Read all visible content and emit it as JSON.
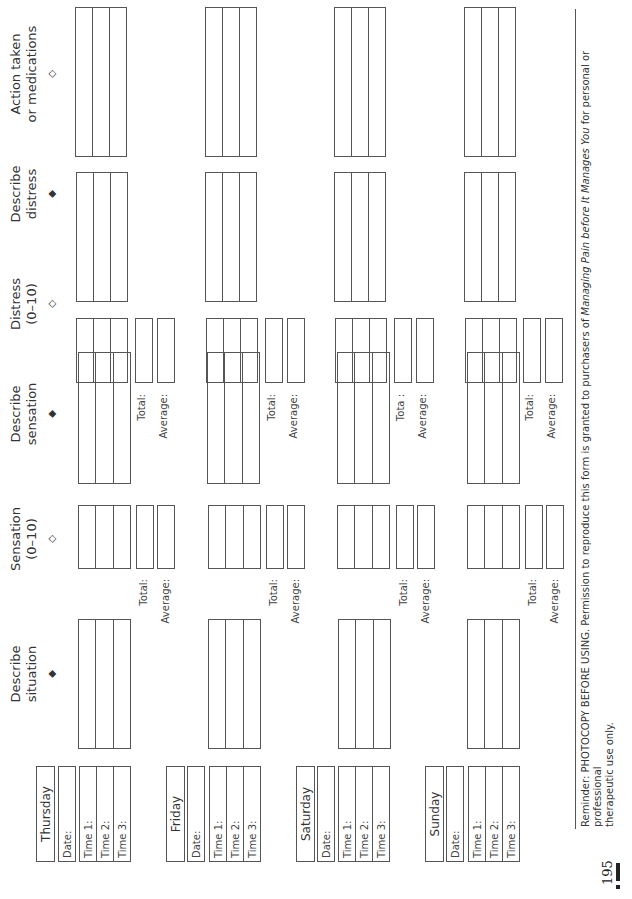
{
  "columns": [
    {
      "label_line1": "Describe",
      "label_line2": "situation",
      "arrow": "solid-arrow-down"
    },
    {
      "label_line1": "Sensation",
      "label_line2": "(0–10)",
      "arrow": "hollow-arrow-down"
    },
    {
      "label_line1": "Describe",
      "label_line2": "sensation",
      "arrow": "solid-arrow-down"
    },
    {
      "label_line1": "Distress",
      "label_line2": "(0–10)",
      "arrow": "hollow-arrow-down"
    },
    {
      "label_line1": "Describe",
      "label_line2": "distress",
      "arrow": "solid-arrow-down"
    },
    {
      "label_line1": "Action taken",
      "label_line2": "or medications",
      "arrow": "hollow-arrow-down"
    }
  ],
  "arrows": {
    "solid": "◆",
    "hollow": "◇"
  },
  "days": [
    {
      "name": "Thursday",
      "date_label": "Date:",
      "times": [
        "Time 1:",
        "Time 2:",
        "Time 3:"
      ],
      "sensation_total_label": "Total:",
      "sensation_average_label": "Average:",
      "distress_total_label": "Total:",
      "distress_average_label": "Average:"
    },
    {
      "name": "Friday",
      "date_label": "Date:",
      "times": [
        "Time 1:",
        "Time 2:",
        "Time 3:"
      ],
      "sensation_total_label": "Total:",
      "sensation_average_label": "Average:",
      "distress_total_label": "Total:",
      "distress_average_label": "Average:"
    },
    {
      "name": "Saturday",
      "date_label": "Date:",
      "times": [
        "Time 1:",
        "Time 2:",
        "Time 3:"
      ],
      "sensation_total_label": "Total:",
      "sensation_average_label": "Average:",
      "distress_total_label": "Tota :",
      "distress_average_label": "Average:"
    },
    {
      "name": "Sunday",
      "date_label": "Date:",
      "times": [
        "Time 1:",
        "Time 2:",
        "Time 3:"
      ],
      "sensation_total_label": "Total:",
      "sensation_average_label": "Average:",
      "distress_total_label": "Total:",
      "distress_average_label": "Average:"
    }
  ],
  "footer": {
    "line1_prefix": "Reminder: PHOTOCOPY BEFORE USING. Permission to reproduce this form is granted to purchasers of ",
    "book_title": "Managing Pain before It Manages You",
    "line1_suffix": " for personal or professional",
    "line2": "therapeutic use only.",
    "page_number": "195"
  }
}
